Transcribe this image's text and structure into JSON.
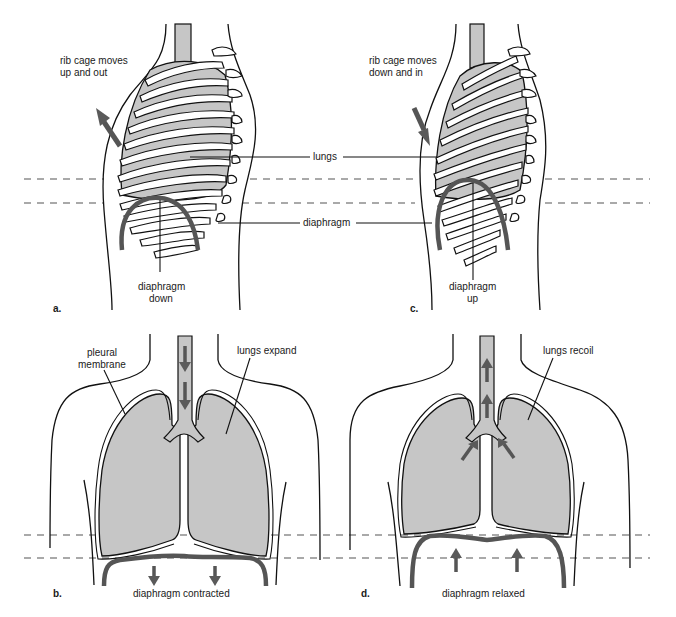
{
  "figure": {
    "colors": {
      "lung_fill": "#c6c6c6",
      "arrow": "#5a5a5a",
      "diaphragm": "#555555",
      "line": "#111111"
    }
  },
  "panels": {
    "a": {
      "letter": "a.",
      "rib_label_line1": "rib cage moves",
      "rib_label_line2": "up and out",
      "diaphragm_label_line1": "diaphragm",
      "diaphragm_label_line2": "down"
    },
    "b": {
      "letter": "b.",
      "pleural_line1": "pleural",
      "pleural_line2": "membrane",
      "lungs_label": "lungs expand",
      "diaphragm_label": "diaphragm contracted"
    },
    "c": {
      "letter": "c.",
      "rib_label_line1": "rib cage moves",
      "rib_label_line2": "down and in",
      "diaphragm_label_line1": "diaphragm",
      "diaphragm_label_line2": "up"
    },
    "d": {
      "letter": "d.",
      "lungs_label": "lungs recoil",
      "diaphragm_label": "diaphragm relaxed"
    },
    "shared": {
      "lungs_label": "lungs",
      "diaphragm_label": "diaphragm"
    }
  }
}
